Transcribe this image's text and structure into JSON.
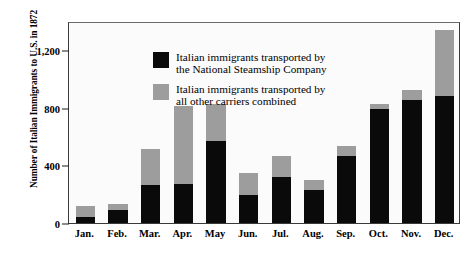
{
  "chart_data": {
    "type": "bar",
    "stacked": true,
    "title": "",
    "xlabel": "",
    "ylabel": "Number of Italian Immigrants to U.S. in 1872",
    "ylim": [
      0,
      1400
    ],
    "yticks": [
      0,
      400,
      800,
      1200
    ],
    "ytick_labels": [
      "0",
      "400",
      "800",
      "1,200"
    ],
    "grid": false,
    "legend_position": "top-left inside plot area",
    "categories": [
      "Jan.",
      "Feb.",
      "Mar.",
      "Apr.",
      "May",
      "Jun.",
      "Jul.",
      "Aug.",
      "Sep.",
      "Oct.",
      "Nov.",
      "Dec."
    ],
    "series": [
      {
        "name": "Italian immigrants transported by\nthe National Steamship Company",
        "short_name": "National Steamship Company",
        "color": "#0a0a0a",
        "values": [
          42,
          90,
          265,
          270,
          570,
          195,
          320,
          230,
          465,
          790,
          850,
          880
        ]
      },
      {
        "name": "Italian immigrants transported by\nall other carriers combined",
        "short_name": "All other carriers combined",
        "color": "#9d9d9d",
        "values": [
          73,
          40,
          250,
          540,
          255,
          155,
          145,
          70,
          70,
          35,
          75,
          460
        ]
      }
    ],
    "totals": [
      115,
      130,
      515,
      810,
      825,
      350,
      465,
      300,
      535,
      825,
      925,
      1340
    ]
  },
  "legend": {
    "entries": [
      {
        "swatch": "black",
        "label": "Italian immigrants transported by\nthe National Steamship Company"
      },
      {
        "swatch": "gray",
        "label": "Italian immigrants transported by\nall other carriers combined"
      }
    ]
  },
  "colors": {
    "series_black": "#0a0a0a",
    "series_gray": "#9d9d9d",
    "axis": "#3a3a3a",
    "background": "#ffffff",
    "plot_background": "#fbfbfb",
    "text": "#000000"
  }
}
